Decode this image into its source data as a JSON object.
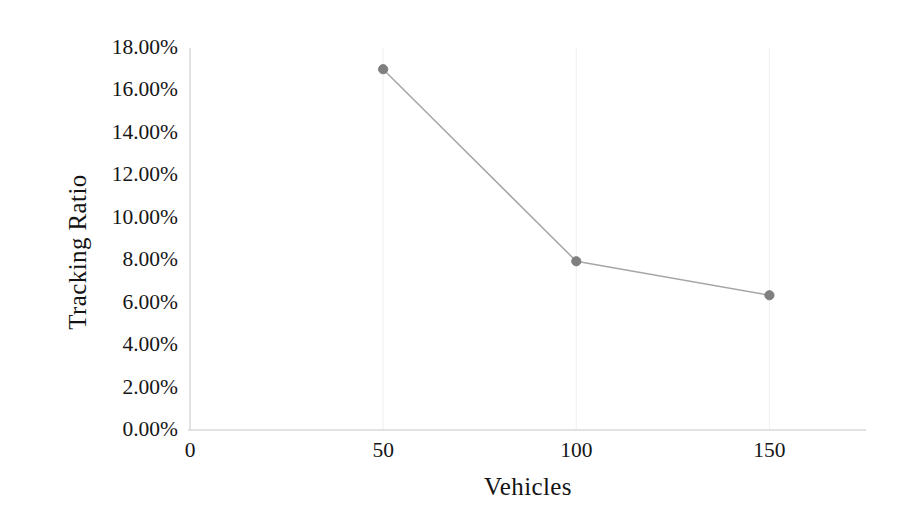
{
  "chart_data": {
    "type": "line",
    "title": "",
    "xlabel": "Vehicles",
    "ylabel": "Tracking Ratio",
    "x": [
      50,
      100,
      150
    ],
    "values": [
      17.0,
      7.95,
      6.35
    ],
    "series": [
      {
        "name": "Tracking Ratio",
        "values": [
          17.0,
          7.95,
          6.35
        ],
        "line_color": "#a6a6a6",
        "marker_color": "#7f7f7f",
        "marker": "circle"
      }
    ],
    "value_format": "percent",
    "xlim": [
      0,
      175
    ],
    "ylim": [
      0,
      18
    ],
    "x_ticks": [
      0,
      50,
      100,
      150
    ],
    "x_tick_labels": [
      "0",
      "50",
      "100",
      "150"
    ],
    "y_ticks": [
      0,
      2,
      4,
      6,
      8,
      10,
      12,
      14,
      16,
      18
    ],
    "y_tick_labels": [
      "0.00%",
      "2.00%",
      "4.00%",
      "6.00%",
      "8.00%",
      "10.00%",
      "12.00%",
      "14.00%",
      "16.00%",
      "18.00%"
    ],
    "grid": {
      "vertical": true,
      "horizontal": false,
      "color": "#f2f2f2"
    },
    "legend": {
      "visible": false,
      "position": "none"
    },
    "axis_line_color": "#d9d9d9",
    "background": "#ffffff"
  },
  "axes": {
    "y_title": "Tracking Ratio",
    "x_title": "Vehicles"
  }
}
